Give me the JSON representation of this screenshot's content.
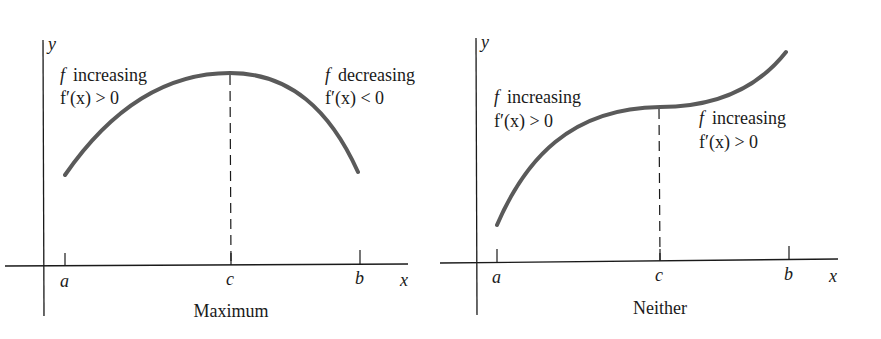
{
  "colors": {
    "curve": "#5a5a5a",
    "axis": "#1a1a1a",
    "text": "#1a1a1a",
    "background": "#ffffff"
  },
  "panels": [
    {
      "caption": "Maximum",
      "y_axis_label": "y",
      "x_axis_label": "x",
      "ticks": [
        "a",
        "c",
        "b"
      ],
      "left_region": {
        "func": "f",
        "desc": "increasing",
        "deriv": "f′(x) > 0"
      },
      "right_region": {
        "func": "f",
        "desc": "decreasing",
        "deriv": "f′(x) < 0"
      }
    },
    {
      "caption": "Neither",
      "y_axis_label": "y",
      "x_axis_label": "x",
      "ticks": [
        "a",
        "c",
        "b"
      ],
      "left_region": {
        "func": "f",
        "desc": "increasing",
        "deriv": "f′(x) > 0"
      },
      "right_region": {
        "func": "f",
        "desc": "increasing",
        "deriv": "f′(x) > 0"
      }
    }
  ]
}
